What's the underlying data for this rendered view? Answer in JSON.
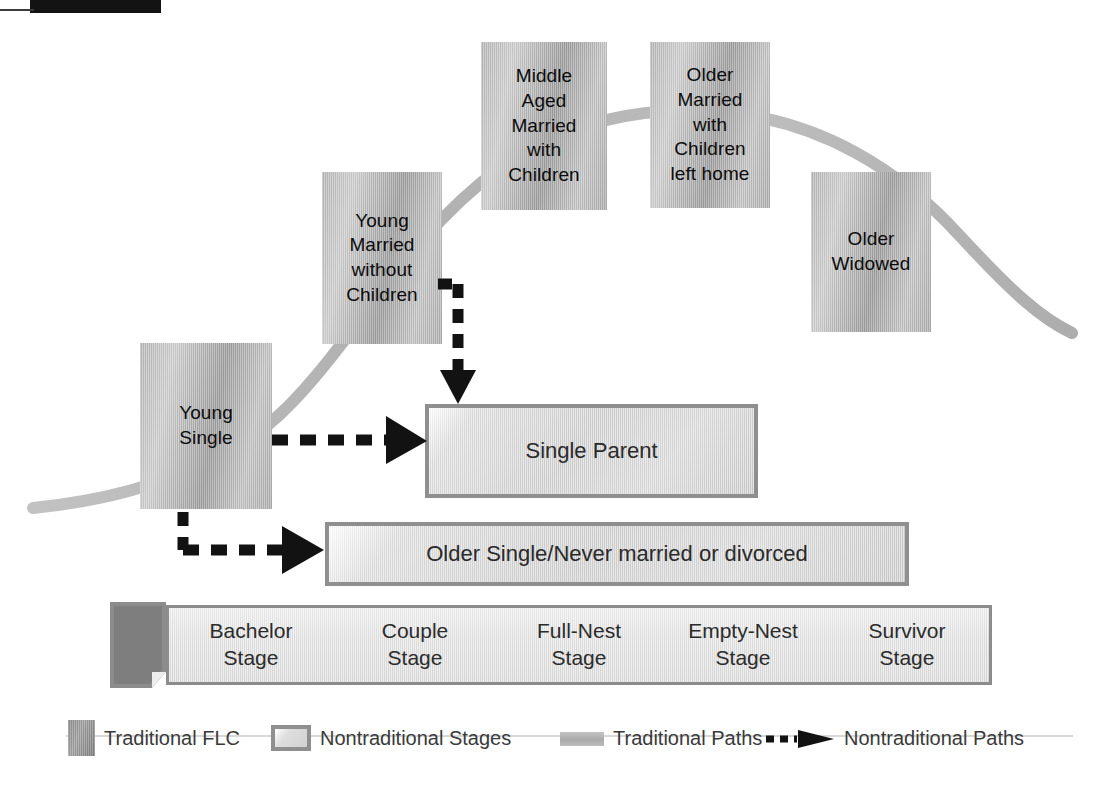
{
  "diagram": {
    "colors": {
      "traditional_box": "#b0b0b0",
      "nontraditional_box": "#d7d7d7",
      "box_border": "#8f8f8f",
      "curve": "#b4b4b4",
      "arrow": "#111111",
      "text": "#1a1a1a",
      "legend_text": "#3a3a3a"
    }
  },
  "traditional_stages": [
    {
      "id": "young-single",
      "label": "Young\nSingle"
    },
    {
      "id": "young-married-no-children",
      "label": "Young\nMarried\nwithout\nChildren"
    },
    {
      "id": "middle-aged-married",
      "label": "Middle\nAged\nMarried\nwith\nChildren"
    },
    {
      "id": "older-married",
      "label": "Older\nMarried\nwith\nChildren\nleft home"
    },
    {
      "id": "older-widowed",
      "label": "Older\nWidowed"
    }
  ],
  "nontraditional_stages": [
    {
      "id": "single-parent",
      "label": "Single Parent"
    },
    {
      "id": "older-single",
      "label": "Older Single/Never married or divorced"
    }
  ],
  "stages_bar": {
    "cells": [
      {
        "id": "bachelor-stage",
        "line1": "Bachelor",
        "line2": "Stage"
      },
      {
        "id": "couple-stage",
        "line1": "Couple",
        "line2": "Stage"
      },
      {
        "id": "full-nest-stage",
        "line1": "Full-Nest",
        "line2": "Stage"
      },
      {
        "id": "empty-nest-stage",
        "line1": "Empty-Nest",
        "line2": "Stage"
      },
      {
        "id": "survivor-stage",
        "line1": "Survivor",
        "line2": "Stage"
      }
    ]
  },
  "legend": {
    "items": [
      {
        "id": "traditional-flc",
        "label": "Traditional FLC",
        "swatch": "dark-grey-box"
      },
      {
        "id": "nontraditional-stages",
        "label": "Nontraditional Stages",
        "swatch": "light-bordered-box"
      },
      {
        "id": "traditional-paths",
        "label": "Traditional Paths",
        "swatch": "grey-bar"
      },
      {
        "id": "nontraditional-paths",
        "label": "Nontraditional Paths",
        "swatch": "dashed-arrow"
      }
    ]
  }
}
